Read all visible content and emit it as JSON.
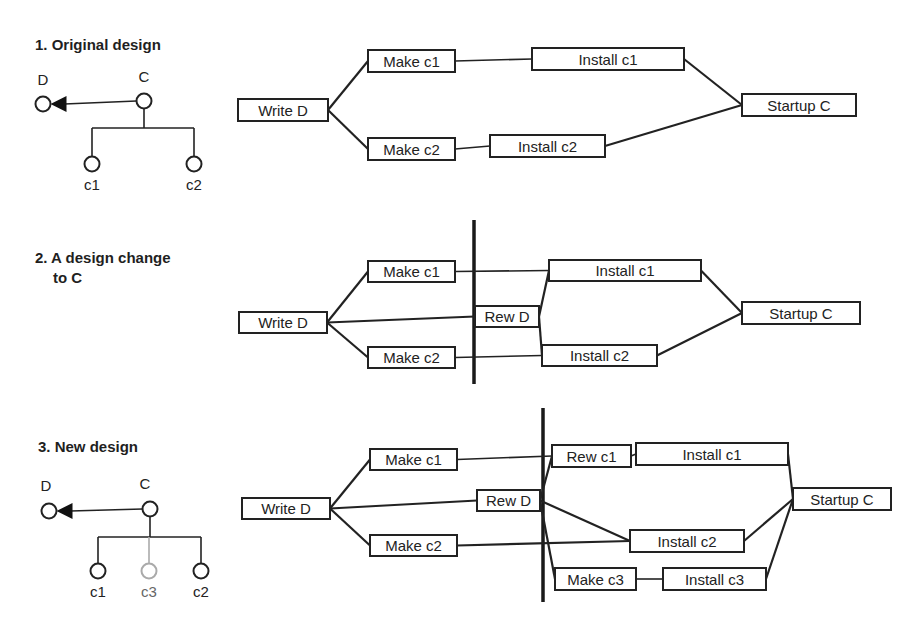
{
  "sections": [
    {
      "title": [
        "1. Original design"
      ],
      "tree": {
        "parent": "C",
        "dependency": "D",
        "children": [
          {
            "label": "c1",
            "new": false
          },
          {
            "label": "c2",
            "new": false
          }
        ]
      },
      "tasks": [
        {
          "id": "writeD",
          "label": "Write D"
        },
        {
          "id": "makeC1",
          "label": "Make c1"
        },
        {
          "id": "makeC2",
          "label": "Make c2"
        },
        {
          "id": "instC1",
          "label": "Install c1"
        },
        {
          "id": "instC2",
          "label": "Install c2"
        },
        {
          "id": "startC",
          "label": "Startup C"
        }
      ],
      "links": [
        [
          "writeD",
          "makeC1"
        ],
        [
          "writeD",
          "makeC2"
        ],
        [
          "makeC1",
          "instC1"
        ],
        [
          "makeC2",
          "instC2"
        ],
        [
          "instC1",
          "startC"
        ],
        [
          "instC2",
          "startC"
        ]
      ],
      "has_change_line": false
    },
    {
      "title": [
        "2. A design change",
        "to C"
      ],
      "tree": null,
      "tasks": [
        {
          "id": "writeD",
          "label": "Write D"
        },
        {
          "id": "makeC1",
          "label": "Make c1"
        },
        {
          "id": "makeC2",
          "label": "Make c2"
        },
        {
          "id": "rewD",
          "label": "Rew D"
        },
        {
          "id": "instC1",
          "label": "Install c1"
        },
        {
          "id": "instC2",
          "label": "Install c2"
        },
        {
          "id": "startC",
          "label": "Startup C"
        }
      ],
      "links": [
        [
          "writeD",
          "makeC1"
        ],
        [
          "writeD",
          "makeC2"
        ],
        [
          "writeD",
          "rewD"
        ],
        [
          "makeC1",
          "instC1"
        ],
        [
          "makeC2",
          "instC2"
        ],
        [
          "rewD",
          "instC1"
        ],
        [
          "rewD",
          "instC2"
        ],
        [
          "instC1",
          "startC"
        ],
        [
          "instC2",
          "startC"
        ]
      ],
      "has_change_line": true
    },
    {
      "title": [
        "3. New design"
      ],
      "tree": {
        "parent": "C",
        "dependency": "D",
        "children": [
          {
            "label": "c1",
            "new": false
          },
          {
            "label": "c3",
            "new": true
          },
          {
            "label": "c2",
            "new": false
          }
        ]
      },
      "tasks": [
        {
          "id": "writeD",
          "label": "Write D"
        },
        {
          "id": "makeC1",
          "label": "Make c1"
        },
        {
          "id": "makeC2",
          "label": "Make c2"
        },
        {
          "id": "rewD",
          "label": "Rew D"
        },
        {
          "id": "rewC1",
          "label": "Rew c1"
        },
        {
          "id": "instC1",
          "label": "Install c1"
        },
        {
          "id": "instC2",
          "label": "Install c2"
        },
        {
          "id": "makeC3",
          "label": "Make c3"
        },
        {
          "id": "instC3",
          "label": "Install c3"
        },
        {
          "id": "startC",
          "label": "Startup C"
        }
      ],
      "links": [
        [
          "writeD",
          "makeC1"
        ],
        [
          "writeD",
          "makeC2"
        ],
        [
          "writeD",
          "rewD"
        ],
        [
          "makeC1",
          "rewC1"
        ],
        [
          "rewC1",
          "instC1"
        ],
        [
          "rewD",
          "rewC1"
        ],
        [
          "rewD",
          "instC2"
        ],
        [
          "rewD",
          "makeC3"
        ],
        [
          "makeC2",
          "instC2"
        ],
        [
          "makeC3",
          "instC3"
        ],
        [
          "instC1",
          "startC"
        ],
        [
          "instC2",
          "startC"
        ],
        [
          "instC3",
          "startC"
        ]
      ],
      "has_change_line": true
    }
  ]
}
